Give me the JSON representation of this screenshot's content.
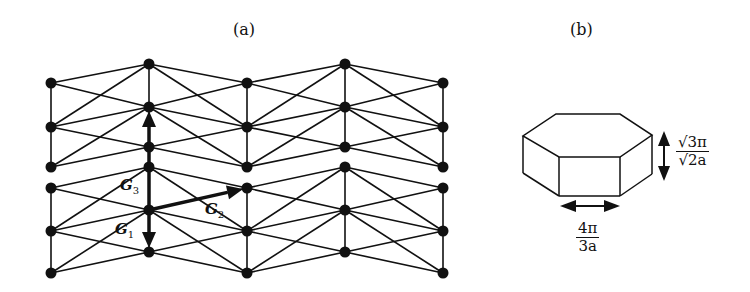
{
  "figure": {
    "panel_a": {
      "label": "(a)",
      "description": "Triangular lattice of nodes with reciprocal lattice vectors",
      "columns_x": [
        51,
        149,
        247,
        345,
        443
      ],
      "even_column_nodes_y": [
        83,
        127,
        167,
        188,
        231,
        273
      ],
      "odd_column_nodes_y": [
        64,
        107,
        147,
        167,
        210,
        252
      ],
      "vectors": [
        {
          "name": "G1",
          "symbol": "G",
          "subscript": "1",
          "from": [
            149,
            210
          ],
          "to": [
            149,
            252
          ]
        },
        {
          "name": "G2",
          "symbol": "G",
          "subscript": "2",
          "from": [
            149,
            210
          ],
          "to": [
            247,
            188
          ]
        },
        {
          "name": "G3",
          "symbol": "G",
          "subscript": "3",
          "from": [
            149,
            210
          ],
          "to": [
            149,
            107
          ]
        }
      ]
    },
    "panel_b": {
      "label": "(b)",
      "description": "Hexagonal prism Brillouin zone",
      "height_label": {
        "numerator": "√3π",
        "denominator": "√2a"
      },
      "width_label": {
        "numerator": "4π",
        "denominator": "3a"
      }
    }
  }
}
